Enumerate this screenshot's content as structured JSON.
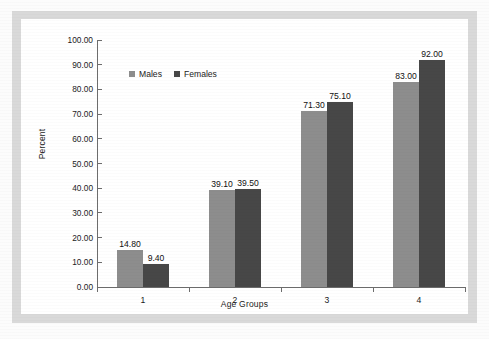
{
  "chart_data": {
    "type": "bar",
    "title": "",
    "subtitle": "",
    "xlabel": "Age Groups",
    "ylabel": "Percent",
    "categories": [
      "1",
      "2",
      "3",
      "4"
    ],
    "series": [
      {
        "name": "Males",
        "color": "#8d8d8d",
        "values": [
          14.8,
          39.1,
          71.3,
          83.0
        ],
        "labels": [
          "14.80",
          "39.10",
          "71.30",
          "83.00"
        ]
      },
      {
        "name": "Females",
        "color": "#474747",
        "values": [
          9.4,
          39.5,
          75.1,
          92.0
        ],
        "labels": [
          "9.40",
          "39.50",
          "75.10",
          "92.00"
        ]
      }
    ],
    "ylim": [
      0,
      100
    ],
    "ytick_values": [
      0,
      10,
      20,
      30,
      40,
      50,
      60,
      70,
      80,
      90,
      100
    ],
    "ytick_labels": [
      "0.00",
      "10.00",
      "20.00",
      "30.00",
      "40.00",
      "50.00",
      "60.00",
      "70.00",
      "80.00",
      "90.00",
      "100.00"
    ],
    "grid": false,
    "legend_position": "top-left",
    "legend_entries": [
      "Males",
      "Females"
    ]
  },
  "legend": {
    "males_label": "Males",
    "females_label": "Females"
  },
  "axes": {
    "y_title": "Percent",
    "x_title": "Age Groups"
  },
  "colors": {
    "males": "#8d8d8d",
    "females": "#474747",
    "frame": "#d9d9d9",
    "plot_background": "#ffffff",
    "axis": "#6d6d6d",
    "text": "#1b1b1b"
  }
}
